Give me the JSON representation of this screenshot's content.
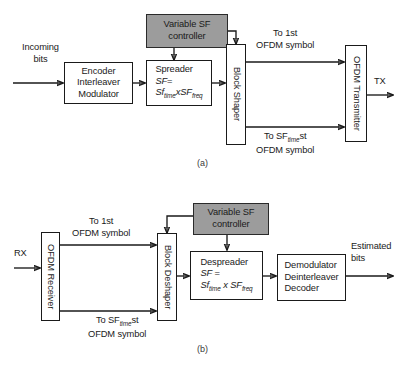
{
  "figure": {
    "panel_a_label": "(a)",
    "panel_b_label": "(b)"
  },
  "colors": {
    "controller_fill": "#9c9c9c",
    "box_stroke": "#1a1a1a",
    "box_fill": "#ffffff",
    "background": "#ffffff"
  },
  "panel_a": {
    "caption": "(a)",
    "input_label_line1": "Incoming",
    "input_label_line2": "bits",
    "output_label": "TX",
    "controller": {
      "line1": "Variable SF",
      "line2": "controller"
    },
    "encoder": {
      "line1": "Encoder",
      "line2": "Interleaver",
      "line3": "Modulator"
    },
    "spreader": {
      "title": "Spreader",
      "eq_lhs": "SF",
      "eq_sign": "=",
      "factor1_base": "Sf",
      "factor1_sub": "time",
      "times": "x",
      "factor2_base": "SF",
      "factor2_sub": "freq"
    },
    "block_shaper": "Block Shaper",
    "ofdm_transmitter": "OFDM Transmitter",
    "branch_top": {
      "line1": "To 1st",
      "line2": "OFDM symbol"
    },
    "branch_bottom": {
      "prefix": "To SF",
      "sub": "time",
      "suffix": "st",
      "line2": "OFDM symbol"
    }
  },
  "panel_b": {
    "caption": "(b)",
    "input_label": "RX",
    "output_label_line1": "Estimated",
    "output_label_line2": "bits",
    "controller": {
      "line1": "Variable SF",
      "line2": "controller"
    },
    "ofdm_receiver": "OFDM Receiver",
    "block_deshaper": "Block Deshaper",
    "despreader": {
      "title": "Despreader",
      "eq_lhs": "SF",
      "eq_sign": "=",
      "factor1_base": "Sf",
      "factor1_sub": "time",
      "times": "x",
      "factor2_base": "SF",
      "factor2_sub": "freq"
    },
    "demodulator": {
      "line1": "Demodulator",
      "line2": "Deinterleaver",
      "line3": "Decoder"
    },
    "branch_top": {
      "line1": "To 1st",
      "line2": "OFDM symbol"
    },
    "branch_bottom": {
      "prefix": "To SF",
      "sub": "time",
      "suffix": "st",
      "line2": "OFDM symbol"
    }
  }
}
